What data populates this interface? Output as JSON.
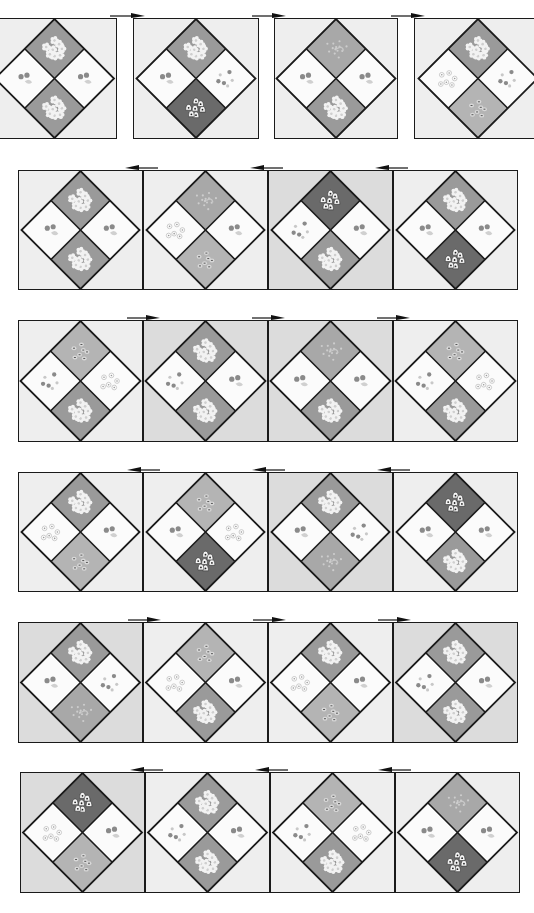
{
  "diagram": {
    "colors": {
      "background_light": "#eeeeee",
      "background_medium": "#dcdcdc",
      "fabric_white": "#fbfbfb",
      "fabric_flower": "#9a9a9a",
      "fabric_light_print": "#b4b4b4",
      "fabric_dark_bell": "#6a6a6a",
      "fabric_speckle": "#a8a8a8",
      "outline": "#1a1a1a",
      "dot": "#8a8a8a"
    },
    "rows": [
      {
        "id": "row-1",
        "joined": false,
        "arrow_direction": "right",
        "blocks": [
          {
            "bg": "light",
            "top": "flower",
            "left": "cherry",
            "right": "cherry",
            "bottom": "flower"
          },
          {
            "bg": "light",
            "top": "flower",
            "left": "cherry",
            "right": "dots",
            "bottom": "bell"
          },
          {
            "bg": "light",
            "top": "speckle",
            "left": "cherry",
            "right": "cherry",
            "bottom": "flower"
          },
          {
            "bg": "light",
            "top": "flower",
            "left": "circles",
            "right": "dots",
            "bottom": "lightprint"
          }
        ]
      },
      {
        "id": "row-2",
        "joined": true,
        "arrow_direction": "left",
        "blocks": [
          {
            "bg": "light",
            "top": "flower",
            "left": "cherry",
            "right": "cherry",
            "bottom": "flower"
          },
          {
            "bg": "light",
            "top": "speckle",
            "left": "circles",
            "right": "cherry",
            "bottom": "lightprint"
          },
          {
            "bg": "medium",
            "top": "bell",
            "left": "dots",
            "right": "cherry",
            "bottom": "flower"
          },
          {
            "bg": "light",
            "top": "flower",
            "left": "cherry",
            "right": "cherry",
            "bottom": "bell"
          }
        ]
      },
      {
        "id": "row-3",
        "joined": true,
        "arrow_direction": "right",
        "blocks": [
          {
            "bg": "light",
            "top": "lightprint",
            "left": "dots",
            "right": "circles",
            "bottom": "flower"
          },
          {
            "bg": "medium",
            "top": "flower",
            "left": "dots",
            "right": "cherry",
            "bottom": "flower"
          },
          {
            "bg": "medium",
            "top": "speckle",
            "left": "cherry",
            "right": "cherry",
            "bottom": "flower"
          },
          {
            "bg": "light",
            "top": "lightprint",
            "left": "dots",
            "right": "circles",
            "bottom": "flower"
          }
        ]
      },
      {
        "id": "row-4",
        "joined": true,
        "arrow_direction": "left",
        "blocks": [
          {
            "bg": "light",
            "top": "flower",
            "left": "circles",
            "right": "cherry",
            "bottom": "lightprint"
          },
          {
            "bg": "light",
            "top": "lightprint",
            "left": "cherry",
            "right": "circles",
            "bottom": "bell"
          },
          {
            "bg": "medium",
            "top": "flower",
            "left": "cherry",
            "right": "dots",
            "bottom": "speckle"
          },
          {
            "bg": "light",
            "top": "bell",
            "left": "cherry",
            "right": "cherry",
            "bottom": "flower"
          }
        ]
      },
      {
        "id": "row-5",
        "joined": true,
        "arrow_direction": "right",
        "blocks": [
          {
            "bg": "medium",
            "top": "flower",
            "left": "cherry",
            "right": "dots",
            "bottom": "speckle"
          },
          {
            "bg": "light",
            "top": "lightprint",
            "left": "circles",
            "right": "cherry",
            "bottom": "flower"
          },
          {
            "bg": "light",
            "top": "flower",
            "left": "circles",
            "right": "cherry",
            "bottom": "lightprint"
          },
          {
            "bg": "medium",
            "top": "flower",
            "left": "dots",
            "right": "cherry",
            "bottom": "flower"
          }
        ]
      },
      {
        "id": "row-6",
        "joined": true,
        "arrow_direction": "left",
        "blocks": [
          {
            "bg": "medium",
            "top": "bell",
            "left": "circles",
            "right": "cherry",
            "bottom": "lightprint"
          },
          {
            "bg": "light",
            "top": "flower",
            "left": "dots",
            "right": "cherry",
            "bottom": "flower"
          },
          {
            "bg": "light",
            "top": "lightprint",
            "left": "dots",
            "right": "circles",
            "bottom": "flower"
          },
          {
            "bg": "light",
            "top": "speckle",
            "left": "cherry",
            "right": "cherry",
            "bottom": "bell"
          }
        ]
      }
    ]
  }
}
